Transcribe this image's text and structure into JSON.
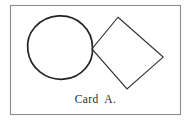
{
  "figure": {
    "name": "Card A",
    "caption": "Card  A.",
    "background_color": "#fefefe",
    "ink_color": "#262626",
    "border": {
      "name": "card-border-rectangle",
      "x": 10,
      "y": 5,
      "width": 170,
      "height": 109,
      "stroke": "#8d8d8d",
      "stroke_width": 1.2
    },
    "shapes": [
      {
        "name": "circle",
        "type": "circle",
        "cx": 60.5,
        "cy": 49.5,
        "r": 32,
        "stroke": "#222222",
        "stroke_width": 1.6,
        "fill": "none"
      },
      {
        "name": "rotated-square",
        "type": "square",
        "rotation_deg": 45,
        "points": "118,17 163,57 127,89 92,49",
        "side_estimate": 50,
        "stroke": "#333333",
        "stroke_width": 1.1,
        "fill": "none"
      }
    ],
    "tangent_point": {
      "name": "tangency-point",
      "x": 92,
      "y": 49,
      "description": "left vertex of square meets right edge of circle"
    }
  }
}
